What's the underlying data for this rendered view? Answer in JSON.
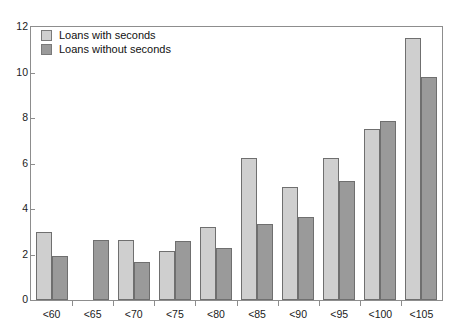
{
  "top_clipped_text": "",
  "legend": {
    "position": "top-left inside plot",
    "entries": [
      {
        "label": "Loans with seconds",
        "color": "#cfcfcf",
        "swatch": "light-swatch"
      },
      {
        "label": "Loans without seconds",
        "color": "#9a9a9a",
        "swatch": "dark-swatch"
      }
    ]
  },
  "axis": {
    "y_ticks": [
      "0",
      "2",
      "4",
      "6",
      "8",
      "10",
      "12"
    ],
    "x_ticks": [
      "<60",
      "<65",
      "<70",
      "<75",
      "<80",
      "<85",
      "<90",
      "<95",
      "<100",
      "<105"
    ]
  },
  "chart_data": {
    "type": "bar",
    "title": "",
    "subtitle": "",
    "xlabel": "",
    "ylabel": "",
    "ylim": [
      0,
      12
    ],
    "ytick_values": [
      0,
      2,
      4,
      6,
      8,
      10,
      12
    ],
    "grid": false,
    "legend_position": "top-left",
    "categories": [
      "<60",
      "<65",
      "<70",
      "<75",
      "<80",
      "<85",
      "<90",
      "<95",
      "<100",
      "<105"
    ],
    "series": [
      {
        "name": "Loans with seconds",
        "color": "#cfcfcf",
        "values": [
          3.0,
          0.0,
          2.65,
          2.15,
          3.2,
          6.25,
          4.95,
          6.25,
          7.5,
          11.5
        ]
      },
      {
        "name": "Loans without seconds",
        "color": "#9a9a9a",
        "values": [
          1.95,
          2.65,
          1.65,
          2.6,
          2.3,
          3.35,
          3.65,
          5.25,
          7.85,
          9.8
        ]
      }
    ]
  }
}
